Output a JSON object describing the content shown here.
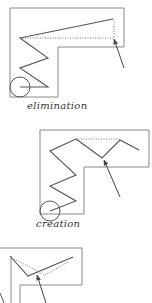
{
  "diagrams": [
    {
      "caption": "elimination",
      "outline": "10,8 124,8 124,47 58,47 58,97 10,97 10,8",
      "path": "113,19 20,38 48,58 20,68 48,87 20,87",
      "dotted": "20,38 114,38 114,19",
      "circle": {
        "cx": 20,
        "cy": 87,
        "r": 10
      },
      "arrow": {
        "x1": 124,
        "y1": 68,
        "x2": 114,
        "y2": 39
      }
    },
    {
      "caption": "creation",
      "outline": "40,130 149,130 149,167 84,167 84,214 40,214 40,130",
      "path": "76,139 50,151 76,175 50,186 76,201 50,211",
      "path2": "76,139 102,158 120,140 139,150",
      "dotted": "76,139 120,139",
      "circle": {
        "cx": 50,
        "cy": 213,
        "r": 10
      },
      "arrow": {
        "x1": 120,
        "y1": 197,
        "x2": 104,
        "y2": 160
      }
    },
    {
      "caption": "",
      "outline": "0,248 82,248 82,285 20,285 20,303",
      "path": "10,256 28,276 73,257",
      "dotted": "14,259 45,275 58,268 68,262",
      "extra_lines": [
        {
          "x1": 11,
          "y1": 256,
          "x2": 11,
          "y2": 303
        },
        {
          "x1": 0,
          "y1": 293,
          "x2": 4,
          "y2": 303
        }
      ],
      "arrow": {
        "x1": 46,
        "y1": 303,
        "x2": 37,
        "y2": 274
      }
    }
  ],
  "colors": {
    "stroke": "#555555",
    "outline": "#888888",
    "dotted": "#777777"
  }
}
